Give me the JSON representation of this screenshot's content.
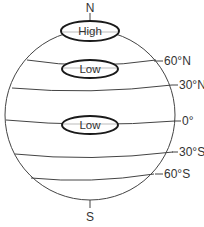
{
  "diagram": {
    "poles": {
      "north": "N",
      "south": "S"
    },
    "latitudes": [
      {
        "label": "60°N",
        "id": "60n"
      },
      {
        "label": "30°N",
        "id": "30n"
      },
      {
        "label": "0°",
        "id": "equator"
      },
      {
        "label": "30°S",
        "id": "30s"
      },
      {
        "label": "60°S",
        "id": "60s"
      }
    ],
    "pressure_zones": [
      {
        "label": "High",
        "location": "north-pole"
      },
      {
        "label": "Low",
        "location": "60N"
      },
      {
        "label": "Low",
        "location": "equator"
      }
    ],
    "colors": {
      "line": "#444444",
      "oval_stroke": "#1a1a1a",
      "text": "#333333",
      "background": "#ffffff"
    }
  }
}
